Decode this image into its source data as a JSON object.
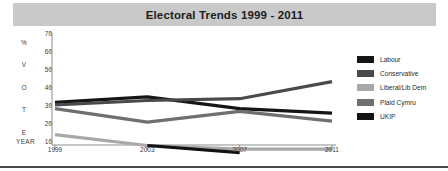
{
  "header": {
    "title": "Electoral Trends 1999 - 2011"
  },
  "axis": {
    "y_letters": [
      "%",
      "V",
      "O",
      "T",
      "E"
    ],
    "year_label": "YEAR"
  },
  "legend": {
    "position": "right",
    "items": [
      {
        "label": "Labour",
        "color": "#151515"
      },
      {
        "label": "Conservative",
        "color": "#4a4a4a"
      },
      {
        "label": "Liberal/Lib Dem",
        "color": "#a8a8a8"
      },
      {
        "label": "Plaid Cymru",
        "color": "#6f6f6f"
      },
      {
        "label": "UKIP",
        "color": "#131313"
      }
    ]
  },
  "chart_data": {
    "type": "line",
    "title": "Electoral Trends 1999 - 2011",
    "xlabel": "YEAR",
    "ylabel": "% VOTE",
    "x": [
      "1999",
      "2003",
      "2007",
      "2011"
    ],
    "xticks": [
      "1999",
      "2003",
      "2007",
      "2011"
    ],
    "yticks": [
      10,
      20,
      30,
      40,
      50,
      60,
      70
    ],
    "ylim": [
      0,
      70
    ],
    "grid": false,
    "series": [
      {
        "name": "Labour",
        "color": "#151515",
        "values": [
          31.5,
          34.5,
          28.0,
          25.5
        ]
      },
      {
        "name": "Conservative",
        "color": "#4a4a4a",
        "values": [
          30.0,
          32.5,
          33.5,
          43.0
        ]
      },
      {
        "name": "Liberal/Lib Dem",
        "color": "#a8a8a8",
        "values": [
          13.5,
          7.5,
          5.5,
          5.5
        ]
      },
      {
        "name": "Plaid Cymru",
        "color": "#6f6f6f",
        "values": [
          28.0,
          20.5,
          26.5,
          21.0
        ]
      },
      {
        "name": "UKIP",
        "color": "#131313",
        "values": [
          null,
          7.5,
          3.5,
          null
        ]
      }
    ]
  }
}
